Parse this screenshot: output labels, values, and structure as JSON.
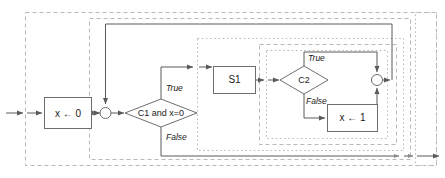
{
  "diagram": {
    "canvas": {
      "width": 445,
      "height": 178
    },
    "colors": {
      "node_stroke": "#6e6e6e",
      "node_fill": "#ffffff",
      "edge": "#5a5a5a",
      "region_stroke": "#b9b9b9",
      "text": "#1a1a1a",
      "background": "#ffffff"
    },
    "nodes": [
      {
        "id": "init",
        "type": "process",
        "label": "x ← 0"
      },
      {
        "id": "merge1",
        "type": "junction",
        "label": ""
      },
      {
        "id": "cond1",
        "type": "decision",
        "label": "C1 and x=0"
      },
      {
        "id": "s1",
        "type": "process",
        "label": "S1"
      },
      {
        "id": "cond2",
        "type": "decision",
        "label": "C2"
      },
      {
        "id": "set1",
        "type": "process",
        "label": "x ← 1"
      },
      {
        "id": "merge2",
        "type": "junction",
        "label": ""
      }
    ],
    "edge_labels": {
      "cond1_true": "True",
      "cond1_false": "False",
      "cond2_true": "True",
      "cond2_false": "False"
    },
    "regions": [
      {
        "id": "outer",
        "style": "dashed"
      },
      {
        "id": "loop-body",
        "style": "dashed"
      },
      {
        "id": "branch",
        "style": "dotted"
      },
      {
        "id": "inner-cond",
        "style": "dashed"
      },
      {
        "id": "inner-most",
        "style": "dotted"
      },
      {
        "id": "right-rail",
        "style": "dotted"
      }
    ]
  }
}
